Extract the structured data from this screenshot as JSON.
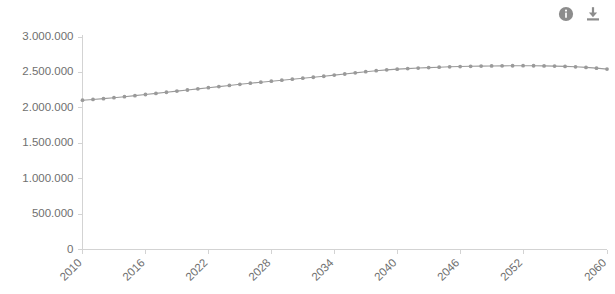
{
  "toolbar": {
    "info_icon_name": "info-icon",
    "info_label": "Info",
    "download_icon_name": "download-icon",
    "download_label": "Download"
  },
  "style": {
    "series_color": "#9a9a9a",
    "axis_color": "#d3d3d3",
    "tick_text_color": "#6f6f6f",
    "background": "#ffffff"
  },
  "chart_data": {
    "type": "line",
    "title": "",
    "subtitle": "",
    "xlabel": "",
    "ylabel": "",
    "legend": [],
    "legend_position": "none",
    "grid": false,
    "xlim": [
      2010,
      2060
    ],
    "ylim": [
      0,
      3000000
    ],
    "ytick_labels": [
      "3.000.000",
      "2.500.000",
      "2.000.000",
      "1.500.000",
      "1.000.000",
      "500.000",
      "0"
    ],
    "ytick_values": [
      3000000,
      2500000,
      2000000,
      1500000,
      1000000,
      500000,
      0
    ],
    "xtick_labels": [
      "2010",
      "2016",
      "2022",
      "2028",
      "2034",
      "2040",
      "2046",
      "2052",
      "2060"
    ],
    "xtick_values": [
      2010,
      2016,
      2022,
      2028,
      2034,
      2040,
      2046,
      2052,
      2060
    ],
    "xtick_rotation": -45,
    "marker": "circle",
    "x": [
      2010,
      2011,
      2012,
      2013,
      2014,
      2015,
      2016,
      2017,
      2018,
      2019,
      2020,
      2021,
      2022,
      2023,
      2024,
      2025,
      2026,
      2027,
      2028,
      2029,
      2030,
      2031,
      2032,
      2033,
      2034,
      2035,
      2036,
      2037,
      2038,
      2039,
      2040,
      2041,
      2042,
      2043,
      2044,
      2045,
      2046,
      2047,
      2048,
      2049,
      2050,
      2051,
      2052,
      2053,
      2054,
      2055,
      2056,
      2057,
      2058,
      2059,
      2060
    ],
    "values": [
      2108000,
      2118000,
      2130000,
      2143000,
      2157000,
      2172000,
      2188000,
      2204000,
      2220000,
      2236000,
      2252000,
      2268000,
      2284000,
      2300000,
      2316000,
      2332000,
      2348000,
      2362000,
      2376000,
      2390000,
      2404000,
      2418000,
      2432000,
      2446000,
      2462000,
      2478000,
      2494000,
      2510000,
      2524000,
      2536000,
      2546000,
      2554000,
      2562000,
      2568000,
      2574000,
      2579000,
      2583000,
      2586000,
      2589000,
      2591000,
      2593000,
      2594000,
      2595000,
      2594000,
      2592000,
      2589000,
      2585000,
      2579000,
      2571000,
      2560000,
      2547000
    ],
    "series": [
      {
        "name": "Bevölkerung",
        "color": "#9a9a9a",
        "values": [
          2108000,
          2118000,
          2130000,
          2143000,
          2157000,
          2172000,
          2188000,
          2204000,
          2220000,
          2236000,
          2252000,
          2268000,
          2284000,
          2300000,
          2316000,
          2332000,
          2348000,
          2362000,
          2376000,
          2390000,
          2404000,
          2418000,
          2432000,
          2446000,
          2462000,
          2478000,
          2494000,
          2510000,
          2524000,
          2536000,
          2546000,
          2554000,
          2562000,
          2568000,
          2574000,
          2579000,
          2583000,
          2586000,
          2589000,
          2591000,
          2593000,
          2594000,
          2595000,
          2594000,
          2592000,
          2589000,
          2585000,
          2579000,
          2571000,
          2560000,
          2547000
        ]
      }
    ]
  }
}
